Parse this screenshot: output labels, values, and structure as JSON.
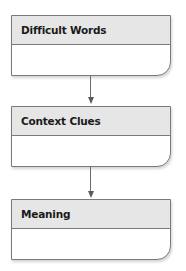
{
  "diagram": {
    "type": "flowchart",
    "direction": "top-to-bottom",
    "nodes": [
      {
        "id": "difficult-words",
        "label": "Difficult Words",
        "body": ""
      },
      {
        "id": "context-clues",
        "label": "Context Clues",
        "body": ""
      },
      {
        "id": "meaning",
        "label": "Meaning",
        "body": ""
      }
    ],
    "edges": [
      {
        "from": "difficult-words",
        "to": "context-clues"
      },
      {
        "from": "context-clues",
        "to": "meaning"
      }
    ]
  },
  "colors": {
    "header_fill": "#e6e6e6",
    "body_fill": "#ffffff",
    "border": "#7a7a7a",
    "arrow": "#5a5a5a"
  }
}
